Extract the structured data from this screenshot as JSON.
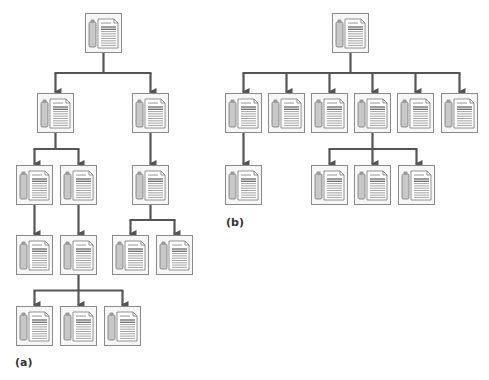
{
  "colors": {
    "line": "#555555",
    "node_border": "#8a8a8a",
    "node_bg": "#f7f7f7",
    "cylinder_fill": "#c8c8c8",
    "doc_fill": "#ffffff",
    "text": "#333333"
  },
  "node_icon": "server-document-icon",
  "diagrams": [
    {
      "id": "a",
      "label": "(a)",
      "label_pos": [
        15,
        356
      ],
      "nodes": [
        {
          "id": "a0",
          "x": 85,
          "y": 13
        },
        {
          "id": "a1",
          "x": 37,
          "y": 93
        },
        {
          "id": "a2",
          "x": 132,
          "y": 93
        },
        {
          "id": "a3",
          "x": 16,
          "y": 165
        },
        {
          "id": "a4",
          "x": 60,
          "y": 165
        },
        {
          "id": "a5",
          "x": 132,
          "y": 165
        },
        {
          "id": "a6",
          "x": 16,
          "y": 235
        },
        {
          "id": "a7",
          "x": 60,
          "y": 235
        },
        {
          "id": "a8",
          "x": 112,
          "y": 235
        },
        {
          "id": "a9",
          "x": 156,
          "y": 235
        },
        {
          "id": "a10",
          "x": 16,
          "y": 306
        },
        {
          "id": "a11",
          "x": 60,
          "y": 306
        },
        {
          "id": "a12",
          "x": 104,
          "y": 306
        }
      ],
      "edges": [
        [
          "a0",
          "a1"
        ],
        [
          "a0",
          "a2"
        ],
        [
          "a1",
          "a3"
        ],
        [
          "a1",
          "a4"
        ],
        [
          "a2",
          "a5"
        ],
        [
          "a3",
          "a6"
        ],
        [
          "a4",
          "a7"
        ],
        [
          "a5",
          "a8"
        ],
        [
          "a5",
          "a9"
        ],
        [
          "a7",
          "a10"
        ],
        [
          "a7",
          "a11"
        ],
        [
          "a7",
          "a12"
        ]
      ]
    },
    {
      "id": "b",
      "label": "(b)",
      "label_pos": [
        226,
        216
      ],
      "nodes": [
        {
          "id": "b0",
          "x": 332,
          "y": 13
        },
        {
          "id": "b1",
          "x": 225,
          "y": 93
        },
        {
          "id": "b2",
          "x": 268,
          "y": 93
        },
        {
          "id": "b3",
          "x": 311,
          "y": 93
        },
        {
          "id": "b4",
          "x": 354,
          "y": 93
        },
        {
          "id": "b5",
          "x": 397,
          "y": 93
        },
        {
          "id": "b6",
          "x": 441,
          "y": 93
        },
        {
          "id": "b7",
          "x": 225,
          "y": 165
        },
        {
          "id": "b8",
          "x": 311,
          "y": 165
        },
        {
          "id": "b9",
          "x": 354,
          "y": 165
        },
        {
          "id": "b10",
          "x": 398,
          "y": 165
        }
      ],
      "edges": [
        [
          "b0",
          "b1"
        ],
        [
          "b0",
          "b2"
        ],
        [
          "b0",
          "b3"
        ],
        [
          "b0",
          "b4"
        ],
        [
          "b0",
          "b5"
        ],
        [
          "b0",
          "b6"
        ],
        [
          "b1",
          "b7"
        ],
        [
          "b4",
          "b8"
        ],
        [
          "b4",
          "b9"
        ],
        [
          "b4",
          "b10"
        ]
      ]
    }
  ]
}
